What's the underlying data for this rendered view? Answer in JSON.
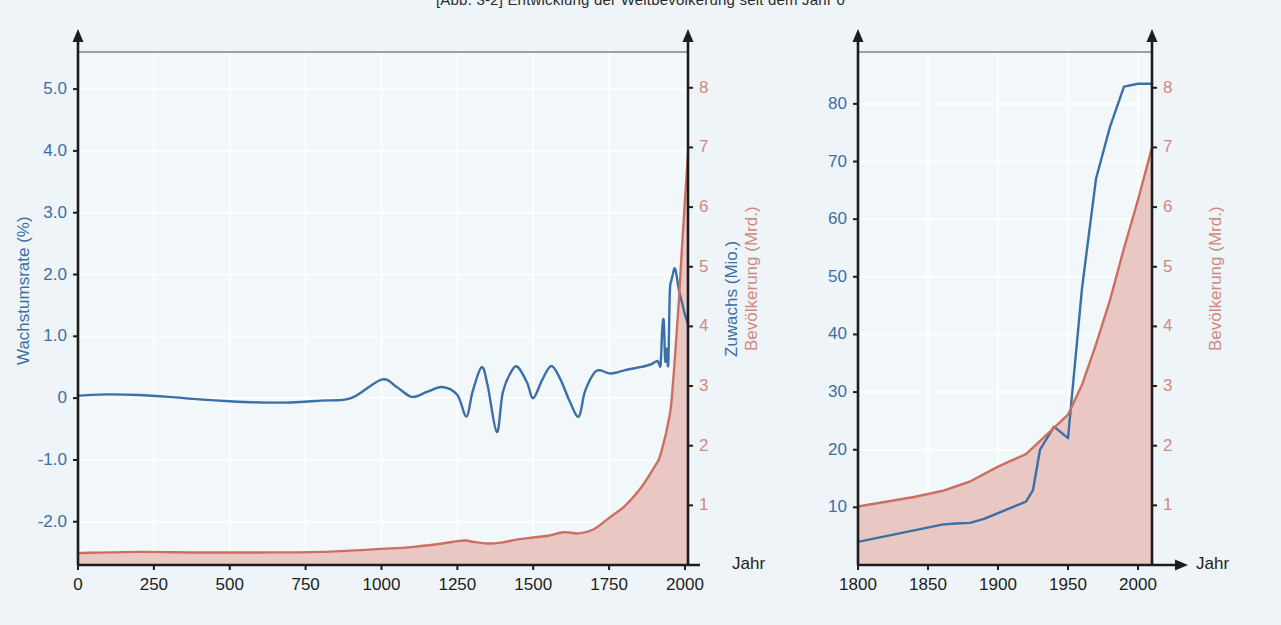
{
  "figure": {
    "title": "[Abb. 3-2]    Entwicklung der Weltbevölkerung seit dem Jahr 0",
    "background_color": "#eef4f7",
    "blue_color": "#3b6fa8",
    "red_color": "#cc6f62",
    "red_fill_color": "#e8c2bd"
  },
  "left_panel": {
    "x_axis_unit": "Jahr",
    "left_axis_title": "Wachstumsrate (%)",
    "right_axis_title": "Bevölkerung (Mrd.)",
    "x_ticks": [
      "0",
      "250",
      "500",
      "750",
      "1000",
      "1250",
      "1500",
      "1750",
      "2000"
    ],
    "y_left_ticks": [
      "5.0",
      "4.0",
      "3.0",
      "2.0",
      "1.0",
      "0",
      "-1.0",
      "-2.0"
    ],
    "y_right_ticks": [
      "8",
      "7",
      "6",
      "5",
      "4",
      "3",
      "2",
      "1"
    ]
  },
  "right_panel": {
    "x_axis_unit": "Jahr",
    "left_axis_title": "Zuwachs (Mio.)",
    "right_axis_title": "Bevölkerung (Mrd.)",
    "x_ticks": [
      "1800",
      "1850",
      "1900",
      "1950",
      "2000"
    ],
    "y_left_ticks": [
      "80",
      "70",
      "60",
      "50",
      "40",
      "30",
      "20",
      "10"
    ],
    "y_right_ticks": [
      "8",
      "7",
      "6",
      "5",
      "4",
      "3",
      "2",
      "1"
    ]
  },
  "chart_data": [
    {
      "id": "left",
      "type": "line",
      "title": "Entwicklung der Weltbevölkerung seit dem Jahr 0",
      "xlabel": "Jahr",
      "xlim": [
        0,
        2010
      ],
      "xticks": [
        0,
        250,
        500,
        750,
        1000,
        1250,
        1500,
        1750,
        2000
      ],
      "grid": true,
      "legend": "none",
      "axes": [
        {
          "side": "left",
          "ylabel": "Wachstumsrate (%)",
          "ylim": [
            -2.7,
            5.6
          ],
          "yticks": [
            5.0,
            4.0,
            3.0,
            2.0,
            1.0,
            0,
            -1.0,
            -2.0
          ],
          "color": "#3b6fa8"
        },
        {
          "side": "right",
          "ylabel": "Bevölkerung (Mrd.)",
          "ylim": [
            0,
            8.6
          ],
          "yticks": [
            8,
            7,
            6,
            5,
            4,
            3,
            2,
            1
          ],
          "color": "#cc6f62"
        }
      ],
      "series": [
        {
          "name": "Wachstumsrate (%)",
          "axis": "left",
          "color": "#3b6fa8",
          "x": [
            0,
            100,
            200,
            300,
            400,
            500,
            600,
            700,
            800,
            900,
            1000,
            1050,
            1100,
            1150,
            1200,
            1250,
            1280,
            1300,
            1330,
            1350,
            1380,
            1400,
            1430,
            1450,
            1480,
            1500,
            1530,
            1560,
            1590,
            1620,
            1650,
            1670,
            1700,
            1720,
            1750,
            1780,
            1800,
            1830,
            1850,
            1870,
            1890,
            1900,
            1910,
            1915,
            1920,
            1925,
            1930,
            1935,
            1940,
            1945,
            1950,
            1955,
            1960,
            1965,
            1970,
            1975,
            1980,
            1990,
            2000,
            2010
          ],
          "values": [
            0.04,
            0.06,
            0.05,
            0.02,
            -0.02,
            -0.05,
            -0.07,
            -0.07,
            -0.04,
            0.0,
            0.3,
            0.18,
            0.02,
            0.1,
            0.18,
            0.05,
            -0.3,
            0.1,
            0.5,
            0.2,
            -0.55,
            0.1,
            0.45,
            0.5,
            0.25,
            0.0,
            0.3,
            0.52,
            0.3,
            -0.05,
            -0.3,
            0.1,
            0.4,
            0.45,
            0.4,
            0.42,
            0.45,
            0.48,
            0.5,
            0.52,
            0.55,
            0.58,
            0.6,
            0.55,
            0.55,
            1.1,
            1.25,
            0.6,
            0.8,
            0.55,
            1.7,
            1.9,
            2.0,
            2.1,
            2.05,
            1.9,
            1.75,
            1.55,
            1.35,
            1.2
          ]
        },
        {
          "name": "Bevölkerung (Mrd.)",
          "axis": "right",
          "color": "#cc6f62",
          "fill": true,
          "x": [
            0,
            200,
            400,
            600,
            800,
            1000,
            1100,
            1200,
            1250,
            1280,
            1300,
            1350,
            1400,
            1450,
            1500,
            1550,
            1600,
            1650,
            1700,
            1750,
            1800,
            1850,
            1900,
            1920,
            1950,
            1960,
            1970,
            1980,
            1990,
            2000,
            2010
          ],
          "values": [
            0.2,
            0.22,
            0.21,
            0.21,
            0.22,
            0.27,
            0.3,
            0.36,
            0.4,
            0.41,
            0.39,
            0.36,
            0.38,
            0.43,
            0.46,
            0.49,
            0.55,
            0.53,
            0.6,
            0.79,
            0.98,
            1.26,
            1.65,
            1.86,
            2.52,
            3.02,
            3.7,
            4.44,
            5.31,
            6.12,
            6.9
          ]
        }
      ]
    },
    {
      "id": "right",
      "type": "line",
      "xlabel": "Jahr",
      "xlim": [
        1800,
        2010
      ],
      "xticks": [
        1800,
        1850,
        1900,
        1950,
        2000
      ],
      "grid": true,
      "legend": "none",
      "axes": [
        {
          "side": "left",
          "ylabel": "Zuwachs (Mio.)",
          "ylim": [
            0,
            89
          ],
          "yticks": [
            80,
            70,
            60,
            50,
            40,
            30,
            20,
            10
          ],
          "color": "#3b6fa8"
        },
        {
          "side": "right",
          "ylabel": "Bevölkerung (Mrd.)",
          "ylim": [
            0,
            8.6
          ],
          "yticks": [
            8,
            7,
            6,
            5,
            4,
            3,
            2,
            1
          ],
          "color": "#cc6f62"
        }
      ],
      "series": [
        {
          "name": "Zuwachs (Mio.)",
          "axis": "left",
          "color": "#3b6fa8",
          "x": [
            1800,
            1820,
            1840,
            1860,
            1870,
            1880,
            1890,
            1900,
            1910,
            1920,
            1925,
            1930,
            1940,
            1950,
            1960,
            1970,
            1980,
            1990,
            2000,
            2010
          ],
          "values": [
            4,
            5,
            6,
            7,
            7.2,
            7.3,
            8,
            9,
            10,
            11,
            13,
            20,
            24,
            22,
            48,
            67,
            76,
            83,
            83.5,
            83.5
          ]
        },
        {
          "name": "Bevölkerung (Mrd.)",
          "axis": "right",
          "color": "#cc6f62",
          "fill": true,
          "x": [
            1800,
            1820,
            1840,
            1860,
            1880,
            1900,
            1920,
            1940,
            1950,
            1960,
            1970,
            1980,
            1990,
            2000,
            2010
          ],
          "values": [
            0.98,
            1.06,
            1.14,
            1.24,
            1.4,
            1.65,
            1.86,
            2.3,
            2.52,
            3.02,
            3.7,
            4.44,
            5.31,
            6.12,
            7.0
          ]
        }
      ]
    }
  ]
}
